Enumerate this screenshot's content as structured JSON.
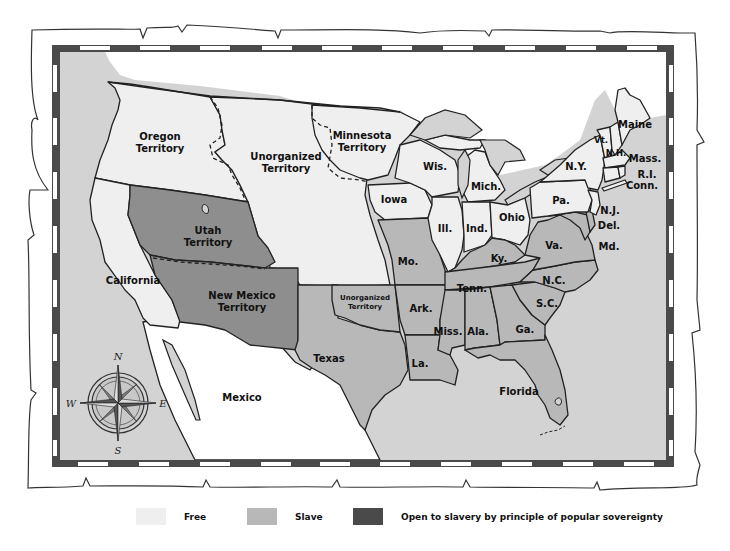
{
  "map": {
    "title_visible": false,
    "colors": {
      "free": "#efefef",
      "slave": "#b8b8b8",
      "popular_sovereignty": "#8e8e8e",
      "water_ocean": "#d3d3d3",
      "foreign_land": "#ffffff",
      "border_dark": "#4a4a4a",
      "border_light": "#ffffff",
      "outline": "#222222"
    },
    "regions": {
      "oregon_territory": {
        "line1": "Oregon",
        "line2": "Territory",
        "status": "free"
      },
      "unorganized_territory_north": {
        "line1": "Unorganized",
        "line2": "Territory",
        "status": "free"
      },
      "minnesota_territory": {
        "line1": "Minnesota",
        "line2": "Territory",
        "status": "free"
      },
      "utah_territory": {
        "line1": "Utah",
        "line2": "Territory",
        "status": "popular_sovereignty"
      },
      "new_mexico_territory": {
        "line1": "New Mexico",
        "line2": "Territory",
        "status": "popular_sovereignty"
      },
      "california": {
        "label": "California",
        "status": "free"
      },
      "texas": {
        "label": "Texas",
        "status": "slave"
      },
      "unorganized_territory_south": {
        "line1": "Unorganized",
        "line2": "Territory",
        "status": "slave"
      },
      "mexico": {
        "label": "Mexico",
        "status": "foreign"
      },
      "iowa": {
        "label": "Iowa",
        "status": "free"
      },
      "wisconsin": {
        "label": "Wis.",
        "status": "free"
      },
      "michigan": {
        "label": "Mich.",
        "status": "free"
      },
      "illinois": {
        "label": "Ill.",
        "status": "free"
      },
      "indiana": {
        "label": "Ind.",
        "status": "free"
      },
      "ohio": {
        "label": "Ohio",
        "status": "free"
      },
      "pennsylvania": {
        "label": "Pa.",
        "status": "free"
      },
      "new_york": {
        "label": "N.Y.",
        "status": "free"
      },
      "vermont": {
        "label": "Vt.",
        "status": "free"
      },
      "new_hampshire": {
        "label": "N.H.",
        "status": "free"
      },
      "maine": {
        "label": "Maine",
        "status": "free"
      },
      "massachusetts": {
        "label": "Mass.",
        "status": "free"
      },
      "rhode_island": {
        "label": "R.I.",
        "status": "free"
      },
      "connecticut": {
        "label": "Conn.",
        "status": "free"
      },
      "new_jersey": {
        "label": "N.J.",
        "status": "free"
      },
      "delaware": {
        "label": "Del.",
        "status": "slave"
      },
      "maryland": {
        "label": "Md.",
        "status": "slave"
      },
      "virginia": {
        "label": "Va.",
        "status": "slave"
      },
      "kentucky": {
        "label": "Ky.",
        "status": "slave"
      },
      "missouri": {
        "label": "Mo.",
        "status": "slave"
      },
      "tennessee": {
        "label": "Tenn.",
        "status": "slave"
      },
      "north_carolina": {
        "label": "N.C.",
        "status": "slave"
      },
      "south_carolina": {
        "label": "S.C.",
        "status": "slave"
      },
      "arkansas": {
        "label": "Ark.",
        "status": "slave"
      },
      "mississippi": {
        "label": "Miss.",
        "status": "slave"
      },
      "alabama": {
        "label": "Ala.",
        "status": "slave"
      },
      "georgia": {
        "label": "Ga.",
        "status": "slave"
      },
      "louisiana": {
        "label": "La.",
        "status": "slave"
      },
      "florida": {
        "label": "Florida",
        "status": "slave"
      }
    },
    "compass": {
      "north": "N",
      "south": "S",
      "east": "E",
      "west": "W"
    }
  },
  "legend": {
    "items": [
      {
        "label": "Free",
        "color": "#efefef"
      },
      {
        "label": "Slave",
        "color": "#b8b8b8"
      },
      {
        "label": "Open to slavery by principle of popular sovereignty",
        "color": "#4a4a4a"
      }
    ]
  }
}
